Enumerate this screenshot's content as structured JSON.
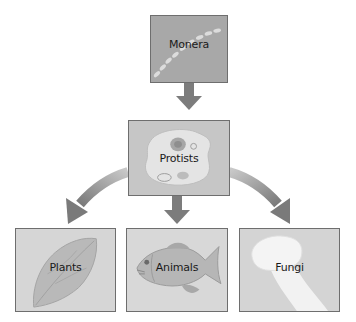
{
  "diagram": {
    "type": "hierarchy",
    "nodes": [
      {
        "id": "monera",
        "label": "Monera",
        "level": 0
      },
      {
        "id": "protists",
        "label": "Protists",
        "level": 1
      },
      {
        "id": "plants",
        "label": "Plants",
        "level": 2
      },
      {
        "id": "animals",
        "label": "Animals",
        "level": 2
      },
      {
        "id": "fungi",
        "label": "Fungi",
        "level": 2
      }
    ],
    "edges": [
      {
        "from": "monera",
        "to": "protists"
      },
      {
        "from": "protists",
        "to": "plants"
      },
      {
        "from": "protists",
        "to": "animals"
      },
      {
        "from": "protists",
        "to": "fungi"
      }
    ],
    "colors": {
      "box_dark": "#a9a9a9",
      "box_light": "#d8d8d8",
      "arrow": "#7a7a7a",
      "border": "#6e6e6e"
    }
  },
  "labels": {
    "monera": "Monera",
    "protists": "Protists",
    "plants": "Plants",
    "animals": "Animals",
    "fungi": "Fungi"
  }
}
